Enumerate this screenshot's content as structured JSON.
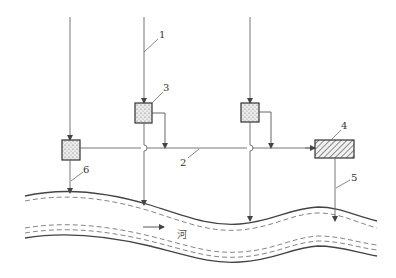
{
  "diagram": {
    "type": "drainage-schematic",
    "labels": {
      "l1": "1",
      "l2": "2",
      "l3": "3",
      "l4": "4",
      "l5": "5",
      "l6": "6",
      "river": "河"
    },
    "colors": {
      "line": "#555555",
      "box_fill": "#d8d8d8",
      "hatch": "#444444"
    },
    "elements": [
      {
        "id": "1",
        "desc": "vertical inflow pipe"
      },
      {
        "id": "2",
        "desc": "horizontal collector main"
      },
      {
        "id": "3",
        "desc": "dotted treatment box"
      },
      {
        "id": "4",
        "desc": "hatched treatment facility"
      },
      {
        "id": "5",
        "desc": "outfall pipe to river"
      },
      {
        "id": "6",
        "desc": "outfall pipe from left box"
      }
    ],
    "flow_direction": "right"
  }
}
